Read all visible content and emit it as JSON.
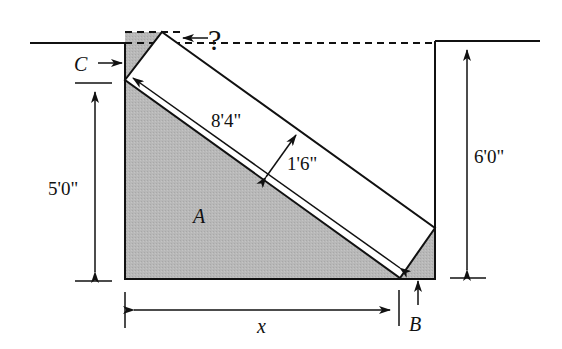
{
  "diagram": {
    "labels": {
      "question": "?",
      "c": "C",
      "a": "A",
      "b": "B",
      "x": "x",
      "board_length": "8'4\"",
      "board_width": "1'6\"",
      "left_height": "5'0\"",
      "right_height": "6'0\""
    },
    "colors": {
      "fill": "#b5b5b5",
      "stroke": "#111111",
      "background": "#ffffff"
    }
  }
}
